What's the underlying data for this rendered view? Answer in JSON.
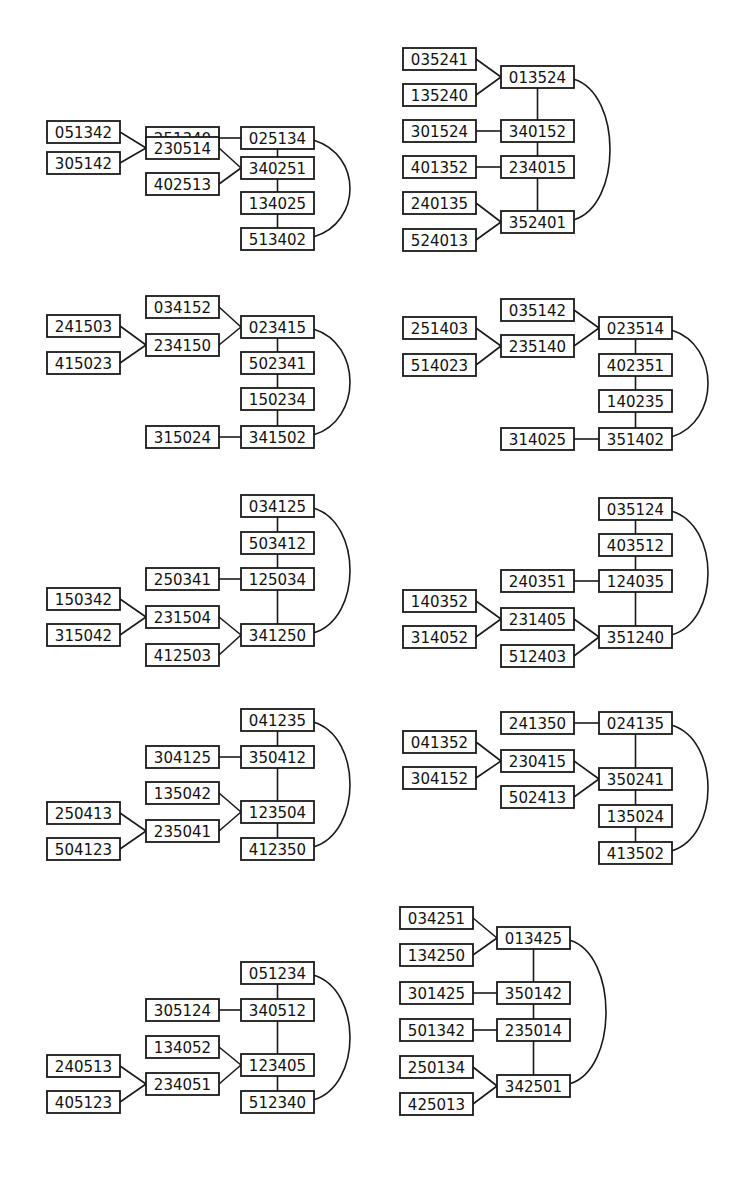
{
  "box": {
    "w": 73,
    "h": 22
  },
  "colors": {
    "stroke": "#1a1a1a",
    "text": "#111111",
    "background": "#ffffff"
  },
  "diagrams": [
    {
      "id": "d1",
      "nodes": [
        {
          "id": "251340",
          "x": 146,
          "y": 127
        },
        {
          "id": "025134",
          "x": 241,
          "y": 127
        },
        {
          "id": "051342",
          "x": 47,
          "y": 121
        },
        {
          "id": "230514",
          "x": 146,
          "y": 137
        },
        {
          "id": "305142",
          "x": 47,
          "y": 152
        },
        {
          "id": "402513",
          "x": 146,
          "y": 173
        },
        {
          "id": "340251",
          "x": 241,
          "y": 157
        },
        {
          "id": "134025",
          "x": 241,
          "y": 192
        },
        {
          "id": "513402",
          "x": 241,
          "y": 228
        }
      ],
      "edges": [
        [
          "251340",
          "025134"
        ],
        [
          "051342",
          "230514"
        ],
        [
          "305142",
          "230514"
        ],
        [
          "230514",
          "340251"
        ],
        [
          "402513",
          "340251"
        ],
        [
          "025134",
          "340251"
        ],
        [
          "340251",
          "134025"
        ],
        [
          "134025",
          "513402"
        ]
      ],
      "arc": [
        "025134",
        "513402"
      ]
    },
    {
      "id": "d2",
      "nodes": [
        {
          "id": "035241",
          "x": 403,
          "y": 48
        },
        {
          "id": "013524",
          "x": 501,
          "y": 66
        },
        {
          "id": "135240",
          "x": 403,
          "y": 84
        },
        {
          "id": "301524",
          "x": 403,
          "y": 120
        },
        {
          "id": "340152",
          "x": 501,
          "y": 120
        },
        {
          "id": "401352",
          "x": 403,
          "y": 156
        },
        {
          "id": "234015",
          "x": 501,
          "y": 156
        },
        {
          "id": "240135",
          "x": 403,
          "y": 192
        },
        {
          "id": "352401",
          "x": 501,
          "y": 211
        },
        {
          "id": "524013",
          "x": 403,
          "y": 229
        }
      ],
      "edges": [
        [
          "035241",
          "013524"
        ],
        [
          "135240",
          "013524"
        ],
        [
          "013524",
          "340152"
        ],
        [
          "301524",
          "340152"
        ],
        [
          "340152",
          "234015"
        ],
        [
          "401352",
          "234015"
        ],
        [
          "234015",
          "352401"
        ],
        [
          "240135",
          "352401"
        ],
        [
          "524013",
          "352401"
        ]
      ],
      "arc": [
        "013524",
        "352401"
      ]
    },
    {
      "id": "d3",
      "nodes": [
        {
          "id": "034152",
          "x": 146,
          "y": 296
        },
        {
          "id": "023415",
          "x": 241,
          "y": 316
        },
        {
          "id": "241503",
          "x": 47,
          "y": 315
        },
        {
          "id": "234150",
          "x": 146,
          "y": 334
        },
        {
          "id": "415023",
          "x": 47,
          "y": 352
        },
        {
          "id": "502341",
          "x": 241,
          "y": 352
        },
        {
          "id": "150234",
          "x": 241,
          "y": 388
        },
        {
          "id": "315024",
          "x": 146,
          "y": 426
        },
        {
          "id": "341502",
          "x": 241,
          "y": 426
        }
      ],
      "edges": [
        [
          "034152",
          "023415"
        ],
        [
          "241503",
          "234150"
        ],
        [
          "415023",
          "234150"
        ],
        [
          "234150",
          "023415"
        ],
        [
          "023415",
          "502341"
        ],
        [
          "502341",
          "150234"
        ],
        [
          "150234",
          "341502"
        ],
        [
          "315024",
          "341502"
        ]
      ],
      "arc": [
        "023415",
        "341502"
      ]
    },
    {
      "id": "d4",
      "nodes": [
        {
          "id": "035142",
          "x": 501,
          "y": 299
        },
        {
          "id": "023514",
          "x": 599,
          "y": 317
        },
        {
          "id": "251403",
          "x": 403,
          "y": 317
        },
        {
          "id": "235140",
          "x": 501,
          "y": 335
        },
        {
          "id": "514023",
          "x": 403,
          "y": 354
        },
        {
          "id": "402351",
          "x": 599,
          "y": 354
        },
        {
          "id": "140235",
          "x": 599,
          "y": 390
        },
        {
          "id": "314025",
          "x": 501,
          "y": 428
        },
        {
          "id": "351402",
          "x": 599,
          "y": 428
        }
      ],
      "edges": [
        [
          "035142",
          "023514"
        ],
        [
          "251403",
          "235140"
        ],
        [
          "514023",
          "235140"
        ],
        [
          "235140",
          "023514"
        ],
        [
          "023514",
          "402351"
        ],
        [
          "402351",
          "140235"
        ],
        [
          "140235",
          "351402"
        ],
        [
          "314025",
          "351402"
        ]
      ],
      "arc": [
        "023514",
        "351402"
      ]
    },
    {
      "id": "d5",
      "nodes": [
        {
          "id": "034125",
          "x": 241,
          "y": 495
        },
        {
          "id": "503412",
          "x": 241,
          "y": 532
        },
        {
          "id": "250341",
          "x": 146,
          "y": 568
        },
        {
          "id": "125034",
          "x": 241,
          "y": 568
        },
        {
          "id": "150342",
          "x": 47,
          "y": 588
        },
        {
          "id": "231504",
          "x": 146,
          "y": 606
        },
        {
          "id": "315042",
          "x": 47,
          "y": 624
        },
        {
          "id": "341250",
          "x": 241,
          "y": 624
        },
        {
          "id": "412503",
          "x": 146,
          "y": 644
        }
      ],
      "edges": [
        [
          "034125",
          "503412"
        ],
        [
          "503412",
          "125034"
        ],
        [
          "250341",
          "125034"
        ],
        [
          "125034",
          "341250"
        ],
        [
          "150342",
          "231504"
        ],
        [
          "315042",
          "231504"
        ],
        [
          "231504",
          "341250"
        ],
        [
          "412503",
          "341250"
        ]
      ],
      "arc": [
        "034125",
        "341250"
      ]
    },
    {
      "id": "d6",
      "nodes": [
        {
          "id": "035124",
          "x": 599,
          "y": 498
        },
        {
          "id": "403512",
          "x": 599,
          "y": 534
        },
        {
          "id": "240351",
          "x": 501,
          "y": 570
        },
        {
          "id": "124035",
          "x": 599,
          "y": 570
        },
        {
          "id": "140352",
          "x": 403,
          "y": 590
        },
        {
          "id": "231405",
          "x": 501,
          "y": 608
        },
        {
          "id": "314052",
          "x": 403,
          "y": 626
        },
        {
          "id": "351240",
          "x": 599,
          "y": 626
        },
        {
          "id": "512403",
          "x": 501,
          "y": 645
        }
      ],
      "edges": [
        [
          "035124",
          "403512"
        ],
        [
          "403512",
          "124035"
        ],
        [
          "240351",
          "124035"
        ],
        [
          "124035",
          "351240"
        ],
        [
          "140352",
          "231405"
        ],
        [
          "314052",
          "231405"
        ],
        [
          "231405",
          "351240"
        ],
        [
          "512403",
          "351240"
        ]
      ],
      "arc": [
        "035124",
        "351240"
      ]
    },
    {
      "id": "d7",
      "nodes": [
        {
          "id": "041235",
          "x": 241,
          "y": 709
        },
        {
          "id": "304125",
          "x": 146,
          "y": 746
        },
        {
          "id": "350412",
          "x": 241,
          "y": 746
        },
        {
          "id": "135042",
          "x": 146,
          "y": 782
        },
        {
          "id": "250413",
          "x": 47,
          "y": 802
        },
        {
          "id": "123504",
          "x": 241,
          "y": 801
        },
        {
          "id": "235041",
          "x": 146,
          "y": 820
        },
        {
          "id": "504123",
          "x": 47,
          "y": 838
        },
        {
          "id": "412350",
          "x": 241,
          "y": 838
        }
      ],
      "edges": [
        [
          "041235",
          "350412"
        ],
        [
          "304125",
          "350412"
        ],
        [
          "350412",
          "123504"
        ],
        [
          "135042",
          "123504"
        ],
        [
          "235041",
          "123504"
        ],
        [
          "250413",
          "235041"
        ],
        [
          "504123",
          "235041"
        ],
        [
          "123504",
          "412350"
        ]
      ],
      "arc": [
        "041235",
        "412350"
      ]
    },
    {
      "id": "d8",
      "nodes": [
        {
          "id": "241350",
          "x": 501,
          "y": 712
        },
        {
          "id": "024135",
          "x": 599,
          "y": 712
        },
        {
          "id": "041352",
          "x": 403,
          "y": 731
        },
        {
          "id": "230415",
          "x": 501,
          "y": 750
        },
        {
          "id": "304152",
          "x": 403,
          "y": 767
        },
        {
          "id": "350241",
          "x": 599,
          "y": 768
        },
        {
          "id": "502413",
          "x": 501,
          "y": 786
        },
        {
          "id": "135024",
          "x": 599,
          "y": 805
        },
        {
          "id": "413502",
          "x": 599,
          "y": 842
        }
      ],
      "edges": [
        [
          "241350",
          "024135"
        ],
        [
          "041352",
          "230415"
        ],
        [
          "304152",
          "230415"
        ],
        [
          "230415",
          "350241"
        ],
        [
          "502413",
          "350241"
        ],
        [
          "024135",
          "350241"
        ],
        [
          "350241",
          "135024"
        ],
        [
          "135024",
          "413502"
        ]
      ],
      "arc": [
        "024135",
        "413502"
      ]
    },
    {
      "id": "d9",
      "nodes": [
        {
          "id": "051234",
          "x": 241,
          "y": 962
        },
        {
          "id": "305124",
          "x": 146,
          "y": 999
        },
        {
          "id": "340512",
          "x": 241,
          "y": 999
        },
        {
          "id": "134052",
          "x": 146,
          "y": 1036
        },
        {
          "id": "240513",
          "x": 47,
          "y": 1055
        },
        {
          "id": "123405",
          "x": 241,
          "y": 1054
        },
        {
          "id": "234051",
          "x": 146,
          "y": 1073
        },
        {
          "id": "405123",
          "x": 47,
          "y": 1091
        },
        {
          "id": "512340",
          "x": 241,
          "y": 1091
        }
      ],
      "edges": [
        [
          "051234",
          "340512"
        ],
        [
          "305124",
          "340512"
        ],
        [
          "340512",
          "123405"
        ],
        [
          "134052",
          "123405"
        ],
        [
          "234051",
          "123405"
        ],
        [
          "240513",
          "234051"
        ],
        [
          "405123",
          "234051"
        ],
        [
          "123405",
          "512340"
        ]
      ],
      "arc": [
        "051234",
        "512340"
      ]
    },
    {
      "id": "d10",
      "nodes": [
        {
          "id": "034251",
          "x": 400,
          "y": 907
        },
        {
          "id": "013425",
          "x": 497,
          "y": 927
        },
        {
          "id": "134250",
          "x": 400,
          "y": 944
        },
        {
          "id": "301425",
          "x": 400,
          "y": 982
        },
        {
          "id": "350142",
          "x": 497,
          "y": 982
        },
        {
          "id": "501342",
          "x": 400,
          "y": 1019
        },
        {
          "id": "235014",
          "x": 497,
          "y": 1019
        },
        {
          "id": "250134",
          "x": 400,
          "y": 1056
        },
        {
          "id": "342501",
          "x": 497,
          "y": 1075
        },
        {
          "id": "425013",
          "x": 400,
          "y": 1093
        }
      ],
      "edges": [
        [
          "034251",
          "013425"
        ],
        [
          "134250",
          "013425"
        ],
        [
          "013425",
          "350142"
        ],
        [
          "301425",
          "350142"
        ],
        [
          "350142",
          "235014"
        ],
        [
          "501342",
          "235014"
        ],
        [
          "235014",
          "342501"
        ],
        [
          "250134",
          "342501"
        ],
        [
          "425013",
          "342501"
        ]
      ],
      "arc": [
        "013425",
        "342501"
      ]
    }
  ]
}
